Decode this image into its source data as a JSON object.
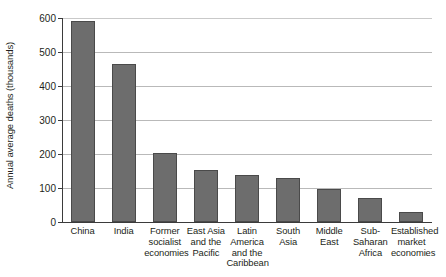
{
  "chart_data": {
    "type": "bar",
    "title": "",
    "xlabel": "",
    "ylabel": "Annual average deaths (thousands)",
    "ylim": [
      0,
      600
    ],
    "yticks": [
      0,
      100,
      200,
      300,
      400,
      500,
      600
    ],
    "ytick_labels": [
      "0",
      "100",
      "200",
      "300",
      "400",
      "500",
      "600"
    ],
    "grid": "horizontal",
    "legend": "none",
    "bar_color": "#6d6d6d",
    "bar_edge_color": "#4a4a4a",
    "gridline_color": "#b9b9b9",
    "axis_color": "#3b3b3b",
    "background": "#ffffff",
    "categories": [
      "China",
      "India",
      "Former socialist economies",
      "East Asia and the Pacific",
      "Latin America and the Caribbean",
      "South Asia",
      "Middle East",
      "Sub-Saharan Africa",
      "Established market economies"
    ],
    "category_label_lines": [
      [
        "China"
      ],
      [
        "India"
      ],
      [
        "Former",
        "socialist",
        "economies"
      ],
      [
        "East Asia",
        "and the",
        "Pacific"
      ],
      [
        "Latin",
        "America",
        "and the",
        "Caribbean"
      ],
      [
        "South",
        "Asia"
      ],
      [
        "Middle",
        "East"
      ],
      [
        "Sub-",
        "Saharan",
        "Africa"
      ],
      [
        "Established",
        "market",
        "economies"
      ]
    ],
    "values": [
      591,
      464,
      203,
      153,
      138,
      129,
      97,
      71,
      29
    ]
  }
}
